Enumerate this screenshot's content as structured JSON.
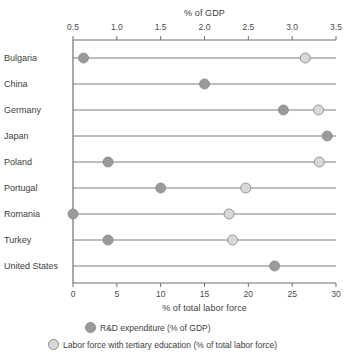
{
  "chart_data": {
    "type": "scatter",
    "subtype": "dumbbell-dot-plot",
    "title": "",
    "top_axis": {
      "label": "% of GDP",
      "ticks": [
        "0.5",
        "1.0",
        "1.5",
        "2.0",
        "2.5",
        "3.0",
        "3.5"
      ],
      "tick_values": [
        0.5,
        1.0,
        1.5,
        2.0,
        2.5,
        3.0,
        3.5
      ],
      "range": [
        0.5,
        3.5
      ]
    },
    "bottom_axis": {
      "label": "% of total labor force",
      "ticks": [
        "0",
        "5",
        "10",
        "15",
        "20",
        "25",
        "30"
      ],
      "tick_values": [
        0,
        5,
        10,
        15,
        20,
        25,
        30
      ],
      "range": [
        0,
        30
      ]
    },
    "categories": [
      "Bulgaria",
      "China",
      "Germany",
      "Japan",
      "Poland",
      "Portugal",
      "Romania",
      "Turkey",
      "United States"
    ],
    "series": [
      {
        "name": "R&D expenditure (% of GDP)",
        "axis": "top",
        "color": "#9a9a9a",
        "values": [
          0.62,
          2.0,
          2.9,
          3.4,
          0.9,
          1.5,
          0.5,
          0.9,
          2.8
        ]
      },
      {
        "name": "Labor force with tertiary education (% of total labor force)",
        "axis": "bottom",
        "color": "#d9d9d9",
        "values": [
          26.5,
          null,
          28.0,
          null,
          28.1,
          19.7,
          17.8,
          18.2,
          null
        ]
      }
    ],
    "legend": [
      {
        "label": "R&D expenditure (% of GDP)",
        "color": "#9a9a9a"
      },
      {
        "label": "Labor force with tertiary education (% of total labor force)",
        "color": "#d9d9d9"
      }
    ],
    "grid": false,
    "legend_position": "bottom",
    "line_color": "#6f6f6f",
    "axis_color": "#6f6f6f"
  }
}
